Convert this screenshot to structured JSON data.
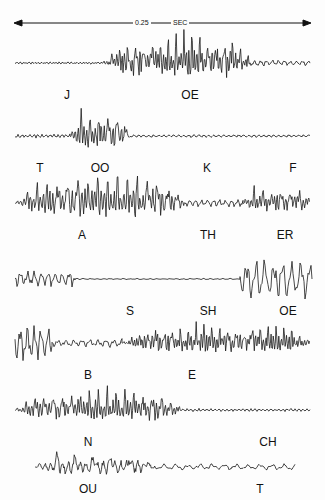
{
  "figure": {
    "scale_bar": {
      "value": "0.25",
      "unit": "SEC"
    },
    "traces": [
      {
        "id": "row1",
        "baseline_y": 63,
        "labels": [
          {
            "text": "J",
            "x": 67
          },
          {
            "text": "OE",
            "x": 190
          }
        ],
        "segments": [
          {
            "from": 15,
            "to": 102,
            "amp": 1.2,
            "period": 3
          },
          {
            "from": 102,
            "to": 250,
            "amp": 20,
            "period": 8,
            "dense": true
          },
          {
            "from": 250,
            "to": 310,
            "amp": 3,
            "period": 6
          }
        ]
      },
      {
        "id": "row2",
        "baseline_y": 136,
        "labels": [
          {
            "text": "T",
            "x": 40
          },
          {
            "text": "OO",
            "x": 100
          },
          {
            "text": "K",
            "x": 207
          },
          {
            "text": "F",
            "x": 293
          }
        ],
        "segments": [
          {
            "from": 15,
            "to": 70,
            "amp": 2,
            "period": 4
          },
          {
            "from": 70,
            "to": 130,
            "amp": 18,
            "period": 9,
            "dense": true
          },
          {
            "from": 130,
            "to": 310,
            "amp": 1.5,
            "period": 5
          }
        ]
      },
      {
        "id": "row3",
        "baseline_y": 203,
        "labels": [
          {
            "text": "A",
            "x": 82
          },
          {
            "text": "TH",
            "x": 208
          },
          {
            "text": "ER",
            "x": 285
          }
        ],
        "segments": [
          {
            "from": 15,
            "to": 185,
            "amp": 20,
            "period": 10,
            "dense": true
          },
          {
            "from": 185,
            "to": 243,
            "amp": 4,
            "period": 6
          },
          {
            "from": 243,
            "to": 310,
            "amp": 12,
            "period": 9,
            "dense": true
          }
        ]
      },
      {
        "id": "row4",
        "baseline_y": 279,
        "labels": [
          {
            "text": "S",
            "x": 130
          },
          {
            "text": "SH",
            "x": 208
          },
          {
            "text": "OE",
            "x": 288
          }
        ],
        "segments": [
          {
            "from": 15,
            "to": 75,
            "amp": 8,
            "period": 7
          },
          {
            "from": 75,
            "to": 240,
            "amp": 1.2,
            "period": 2
          },
          {
            "from": 240,
            "to": 312,
            "amp": 20,
            "period": 9
          }
        ]
      },
      {
        "id": "row5",
        "baseline_y": 343,
        "labels": [
          {
            "text": "B",
            "x": 88
          },
          {
            "text": "E",
            "x": 192
          }
        ],
        "segments": [
          {
            "from": 15,
            "to": 52,
            "amp": 18,
            "period": 7
          },
          {
            "from": 52,
            "to": 122,
            "amp": 4,
            "period": 8
          },
          {
            "from": 122,
            "to": 310,
            "amp": 14,
            "period": 8,
            "dense": true
          }
        ]
      },
      {
        "id": "row6",
        "baseline_y": 410,
        "labels": [
          {
            "text": "N",
            "x": 88
          },
          {
            "text": "CH",
            "x": 268
          }
        ],
        "segments": [
          {
            "from": 15,
            "to": 180,
            "amp": 15,
            "period": 9,
            "dense": true
          },
          {
            "from": 180,
            "to": 310,
            "amp": 1.5,
            "period": 4
          }
        ]
      },
      {
        "id": "row7",
        "baseline_y": 467,
        "labels": [
          {
            "text": "OU",
            "x": 88
          },
          {
            "text": "T",
            "x": 260
          }
        ],
        "segments": [
          {
            "from": 35,
            "to": 155,
            "amp": 10,
            "period": 18,
            "dense": true
          },
          {
            "from": 155,
            "to": 295,
            "amp": 3,
            "period": 12
          }
        ]
      }
    ]
  }
}
